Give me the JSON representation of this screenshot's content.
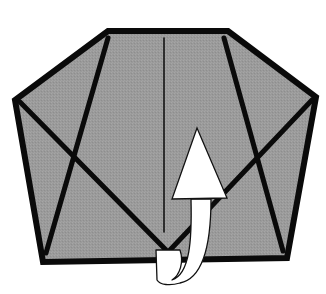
{
  "diagram": {
    "type": "origami-fold-step",
    "description": "Pentagonal paper shape with crease lines; white arrow indicates folding the bottom point up behind (mountain fold)",
    "colors": {
      "paper": "#9a9a9a",
      "edge": "#0a0a0a",
      "arrow_fill": "#ffffff",
      "arrow_stroke": "#111111",
      "background": "#ffffff"
    },
    "shape": {
      "outline_points": "108,31 228,31 316,97 287,258 43,262 15,100"
    },
    "creases": [
      {
        "name": "left-diagonal-crease",
        "x1": 108,
        "y1": 38,
        "x2": 46,
        "y2": 253,
        "width": 5
      },
      {
        "name": "left-cross-crease",
        "x1": 20,
        "y1": 102,
        "x2": 166,
        "y2": 250,
        "width": 5
      },
      {
        "name": "right-diagonal-crease",
        "x1": 224,
        "y1": 38,
        "x2": 283,
        "y2": 251,
        "width": 5
      },
      {
        "name": "right-cross-crease",
        "x1": 312,
        "y1": 100,
        "x2": 170,
        "y2": 250,
        "width": 5
      },
      {
        "name": "center-crease",
        "x1": 164,
        "y1": 38,
        "x2": 164,
        "y2": 232,
        "width": 1.5
      }
    ],
    "arrow": {
      "meaning": "fold-up-behind",
      "head_points": "197,128 227,198 172,199",
      "body_path": "M191,199 L211,199 C211,240 205,278 180,283 C170,286 160,285 157,280 L156,250 L180,250 C184,262 180,275 172,280 C190,274 192,240 191,199 Z"
    }
  }
}
